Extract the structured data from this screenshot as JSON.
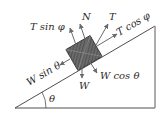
{
  "diagram": {
    "labels": {
      "t_sin_phi": "T sin φ",
      "normal": "N",
      "tension": "T",
      "t_cos_phi": "T cos φ",
      "w_sin_theta": "W sin θ",
      "w_cos_theta": "W cos θ",
      "weight": "W",
      "angle": "θ"
    },
    "colors": {
      "line": "#3a3a3a",
      "block": "#5a5a5a",
      "arrow": "#6a6a6a",
      "text": "#2a2a2a"
    }
  }
}
